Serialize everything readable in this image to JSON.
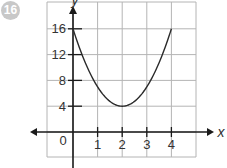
{
  "problem_number": "16",
  "chart_data": {
    "type": "line",
    "title": "",
    "xlabel": "x",
    "ylabel": "y",
    "x_ticks": [
      "1",
      "2",
      "3",
      "4"
    ],
    "y_ticks": [
      "4",
      "8",
      "12",
      "16"
    ],
    "origin_label": "0",
    "xlim": [
      -1,
      5
    ],
    "ylim": [
      -4,
      20
    ],
    "grid": true,
    "legend": null,
    "series": [
      {
        "name": "curve",
        "equation": "y = 3(x - 2)^2 + 4",
        "x": [
          0,
          0.5,
          1,
          1.5,
          2,
          2.5,
          3,
          3.5,
          4
        ],
        "y": [
          16,
          10.75,
          7,
          4.75,
          4,
          4.75,
          7,
          10.75,
          16
        ]
      }
    ],
    "vertex": [
      2,
      4
    ]
  },
  "colors": {
    "grid": "#b4b4b4",
    "axis": "#1a1a1a",
    "curve": "#2a2a2a",
    "badge": "#c8c8c8"
  }
}
